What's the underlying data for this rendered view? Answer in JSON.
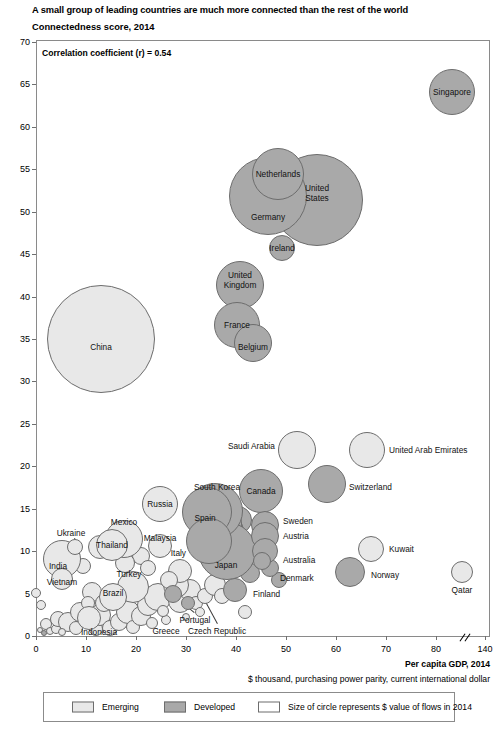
{
  "title": "A small group of leading countries are much more connected than the rest of the world",
  "subtitle": "Connectedness score, 2014",
  "annotation": "Correlation coefficient (r) = 0.54",
  "axis": {
    "x_title": "Per capita GDP, 2014",
    "x_subtitle": "$ thousand, purchasing power parity, current international dollar",
    "x_ticks": [
      "0",
      "10",
      "20",
      "30",
      "40",
      "50",
      "60",
      "70",
      "80",
      "140"
    ],
    "y_ticks": [
      "0",
      "5",
      "10",
      "15",
      "20",
      "25",
      "30",
      "35",
      "40",
      "45",
      "50",
      "55",
      "60",
      "65",
      "70"
    ]
  },
  "legend": {
    "emerging": "Emerging",
    "developed": "Developed",
    "size_note": "Size of circle represents $ value of flows in 2014"
  },
  "colors": {
    "emerging": "#e8e8e8",
    "developed": "#a9a9a9",
    "stroke": "#6d6d6d",
    "frame": "#8a8a8a"
  },
  "chart_data": {
    "type": "scatter",
    "title": "A small group of leading countries are much more connected than the rest of the world",
    "subtitle": "Connectedness score, 2014",
    "xlabel": "Per capita GDP, 2014 ($ thousand, purchasing power parity, current international dollar)",
    "ylabel": "Connectedness score, 2014",
    "xlim": [
      0,
      140
    ],
    "ylim": [
      0,
      70
    ],
    "x_axis_break_after": 80,
    "grid": false,
    "legend_position": "bottom",
    "annotations": [
      "Correlation coefficient (r) = 0.54"
    ],
    "size_encodes": "$ value of flows in 2014",
    "groups": [
      "Emerging",
      "Developed"
    ],
    "points": [
      {
        "name": "Singapore",
        "x": 83.0,
        "y": 65.0,
        "group": "Developed",
        "size": 23
      },
      {
        "name": "United States",
        "x": 55.0,
        "y": 51.5,
        "group": "Developed",
        "size": 46
      },
      {
        "name": "Netherlands",
        "x": 49.0,
        "y": 53.5,
        "group": "Developed",
        "size": 26
      },
      {
        "name": "Germany",
        "x": 46.5,
        "y": 51.0,
        "group": "Developed",
        "size": 39
      },
      {
        "name": "Ireland",
        "x": 49.5,
        "y": 45.5,
        "group": "Developed",
        "size": 13
      },
      {
        "name": "United Kingdom",
        "x": 40.5,
        "y": 41.5,
        "group": "Developed",
        "size": 24
      },
      {
        "name": "China",
        "x": 13.0,
        "y": 34.5,
        "group": "Emerging",
        "size": 54
      },
      {
        "name": "France",
        "x": 40.0,
        "y": 32.0,
        "group": "Developed",
        "size": 23
      },
      {
        "name": "Belgium",
        "x": 43.0,
        "y": 30.0,
        "group": "Developed",
        "size": 19
      },
      {
        "name": "Saudi Arabia",
        "x": 52.0,
        "y": 22.5,
        "group": "Emerging",
        "size": 19
      },
      {
        "name": "United Arab Emirates",
        "x": 66.0,
        "y": 22.5,
        "group": "Emerging",
        "size": 18
      },
      {
        "name": "Switzerland",
        "x": 58.0,
        "y": 18.5,
        "group": "Developed",
        "size": 19
      },
      {
        "name": "Canada",
        "x": 43.5,
        "y": 17.5,
        "group": "Developed",
        "size": 22
      },
      {
        "name": "South Korea",
        "x": 34.0,
        "y": 15.0,
        "group": "Developed",
        "size": 28
      },
      {
        "name": "Spain",
        "x": 33.0,
        "y": 15.0,
        "group": "Developed",
        "size": 25
      },
      {
        "name": "Russia",
        "x": 24.5,
        "y": 16.5,
        "group": "Emerging",
        "size": 18
      },
      {
        "name": "Sweden",
        "x": 45.0,
        "y": 13.5,
        "group": "Developed",
        "size": 14
      },
      {
        "name": "Austria",
        "x": 45.0,
        "y": 11.5,
        "group": "Developed",
        "size": 14
      },
      {
        "name": "Australia",
        "x": 45.0,
        "y": 9.0,
        "group": "Developed",
        "size": 13
      },
      {
        "name": "Denmark",
        "x": 45.0,
        "y": 7.5,
        "group": "Developed",
        "size": 9
      },
      {
        "name": "Japan",
        "x": 37.5,
        "y": 9.0,
        "group": "Developed",
        "size": 29
      },
      {
        "name": "Italy",
        "x": 34.5,
        "y": 11.0,
        "group": "Developed",
        "size": 23
      },
      {
        "name": "Malaysia",
        "x": 24.5,
        "y": 11.0,
        "group": "Emerging",
        "size": 12
      },
      {
        "name": "Mexico",
        "x": 17.0,
        "y": 12.5,
        "group": "Emerging",
        "size": 19
      },
      {
        "name": "Thailand",
        "x": 15.0,
        "y": 11.5,
        "group": "Emerging",
        "size": 16
      },
      {
        "name": "Ukraine",
        "x": 8.5,
        "y": 11.0,
        "group": "Emerging",
        "size": 8
      },
      {
        "name": "India",
        "x": 5.5,
        "y": 9.0,
        "group": "Emerging",
        "size": 19
      },
      {
        "name": "Vietnam",
        "x": 5.5,
        "y": 6.0,
        "group": "Emerging",
        "size": 11
      },
      {
        "name": "Turkey",
        "x": 19.5,
        "y": 6.5,
        "group": "Emerging",
        "size": 16
      },
      {
        "name": "Brazil",
        "x": 15.5,
        "y": 4.5,
        "group": "Emerging",
        "size": 14
      },
      {
        "name": "Portugal",
        "x": 27.5,
        "y": 5.0,
        "group": "Developed",
        "size": 9
      },
      {
        "name": "Greece",
        "x": 25.5,
        "y": 3.0,
        "group": "Emerging",
        "size": 6
      },
      {
        "name": "Czech Republic",
        "x": 30.5,
        "y": 4.0,
        "group": "Developed",
        "size": 7
      },
      {
        "name": "Finland",
        "x": 40.0,
        "y": 5.5,
        "group": "Developed",
        "size": 12
      },
      {
        "name": "Kuwait",
        "x": 67.0,
        "y": 10.5,
        "group": "Emerging",
        "size": 13
      },
      {
        "name": "Norway",
        "x": 63.0,
        "y": 6.5,
        "group": "Developed",
        "size": 15
      },
      {
        "name": "Qatar",
        "x": 85.0,
        "y": 7.5,
        "group": "Emerging",
        "size": 11
      },
      {
        "name": "Indonesia",
        "x": 10.5,
        "y": 2.0,
        "group": "Emerging",
        "size": 12
      }
    ]
  },
  "bubbles": [
    {
      "label": "Singapore",
      "cx": 452,
      "cy": 92,
      "r": 23,
      "group": "developed",
      "lx": 452,
      "ly": 92,
      "anchor": "center"
    },
    {
      "label": "United States",
      "cx": 317,
      "cy": 200,
      "r": 46,
      "group": "developed",
      "lx": 317,
      "ly": 193,
      "anchor": "center",
      "lines": [
        "United",
        "States"
      ]
    },
    {
      "label": "Netherlands",
      "cx": 278,
      "cy": 174,
      "r": 26,
      "group": "developed",
      "lx": 278,
      "ly": 174,
      "anchor": "center"
    },
    {
      "label": "Germany",
      "cx": 268,
      "cy": 196,
      "r": 39,
      "group": "developed",
      "lx": 268,
      "ly": 217,
      "anchor": "center"
    },
    {
      "label": "Ireland",
      "cx": 282,
      "cy": 248,
      "r": 13,
      "group": "developed",
      "lx": 282,
      "ly": 248,
      "anchor": "center"
    },
    {
      "label": "United Kingdom",
      "cx": 240,
      "cy": 285,
      "r": 24,
      "group": "developed",
      "lx": 240,
      "ly": 280,
      "anchor": "center",
      "lines": [
        "United",
        "Kingdom"
      ]
    },
    {
      "label": "China",
      "cx": 101,
      "cy": 339,
      "r": 54,
      "group": "emerging",
      "lx": 101,
      "ly": 347,
      "anchor": "center"
    },
    {
      "label": "France",
      "cx": 237,
      "cy": 325,
      "r": 23,
      "group": "developed",
      "lx": 237,
      "ly": 325,
      "anchor": "center"
    },
    {
      "label": "Belgium",
      "cx": 253,
      "cy": 343,
      "r": 19,
      "group": "developed",
      "lx": 253,
      "ly": 347,
      "anchor": "center"
    },
    {
      "label": "Saudi Arabia",
      "cx": 297,
      "cy": 450,
      "r": 19,
      "group": "emerging",
      "lx": 275,
      "ly": 446,
      "anchor": "right"
    },
    {
      "label": "United Arab Emirates",
      "cx": 367,
      "cy": 450,
      "r": 18,
      "group": "emerging",
      "lx": 389,
      "ly": 450,
      "anchor": "left"
    },
    {
      "label": "Switzerland",
      "cx": 327,
      "cy": 484,
      "r": 19,
      "group": "developed",
      "lx": 349,
      "ly": 487,
      "anchor": "left"
    },
    {
      "label": "Canada",
      "cx": 261,
      "cy": 491,
      "r": 22,
      "group": "developed",
      "lx": 261,
      "ly": 491,
      "anchor": "center"
    },
    {
      "label": "South Korea",
      "cx": 215,
      "cy": 511,
      "r": 28,
      "group": "developed",
      "lx": 217,
      "ly": 487,
      "anchor": "center"
    },
    {
      "label": "Spain",
      "cx": 207,
      "cy": 512,
      "r": 25,
      "group": "developed",
      "lx": 205,
      "ly": 518,
      "anchor": "center"
    },
    {
      "label": "Russia",
      "cx": 160,
      "cy": 504,
      "r": 18,
      "group": "emerging",
      "lx": 160,
      "ly": 504,
      "anchor": "center"
    },
    {
      "label": "Sweden",
      "cx": 265,
      "cy": 525,
      "r": 14,
      "group": "developed",
      "lx": 283,
      "ly": 521,
      "anchor": "left"
    },
    {
      "label": "Austria",
      "cx": 265,
      "cy": 536,
      "r": 14,
      "group": "developed",
      "lx": 283,
      "ly": 536,
      "anchor": "left"
    },
    {
      "label": "Australia",
      "cx": 265,
      "cy": 551,
      "r": 13,
      "group": "developed",
      "lx": 283,
      "ly": 560,
      "anchor": "left"
    },
    {
      "label": "Denmark",
      "cx": 262,
      "cy": 561,
      "r": 9,
      "group": "developed",
      "lx": 280,
      "ly": 578,
      "anchor": "left"
    },
    {
      "label": "Japan",
      "cx": 227,
      "cy": 551,
      "r": 29,
      "group": "developed",
      "lx": 226,
      "ly": 565,
      "anchor": "center"
    },
    {
      "label": "Italy",
      "cx": 209,
      "cy": 541,
      "r": 23,
      "group": "developed",
      "lx": 186,
      "ly": 553,
      "anchor": "right"
    },
    {
      "label": "Malaysia",
      "cx": 160,
      "cy": 546,
      "r": 12,
      "group": "emerging",
      "lx": 160,
      "ly": 538,
      "anchor": "center"
    },
    {
      "label": "Mexico",
      "cx": 124,
      "cy": 539,
      "r": 19,
      "group": "emerging",
      "lx": 124,
      "ly": 522,
      "anchor": "center"
    },
    {
      "label": "Thailand",
      "cx": 112,
      "cy": 545,
      "r": 16,
      "group": "emerging",
      "lx": 112,
      "ly": 545,
      "anchor": "center"
    },
    {
      "label": "Ukraine",
      "cx": 75,
      "cy": 547,
      "r": 8,
      "group": "emerging",
      "lx": 71,
      "ly": 533,
      "anchor": "center"
    },
    {
      "label": "India",
      "cx": 62,
      "cy": 559,
      "r": 19,
      "group": "emerging",
      "lx": 58,
      "ly": 566,
      "anchor": "center"
    },
    {
      "label": "Vietnam",
      "cx": 62,
      "cy": 579,
      "r": 11,
      "group": "emerging",
      "lx": 62,
      "ly": 582,
      "anchor": "center"
    },
    {
      "label": "Turkey",
      "cx": 133,
      "cy": 587,
      "r": 16,
      "group": "emerging",
      "lx": 129,
      "ly": 574,
      "anchor": "center"
    },
    {
      "label": "Brazil",
      "cx": 113,
      "cy": 597,
      "r": 14,
      "group": "emerging",
      "lx": 113,
      "ly": 593,
      "anchor": "center"
    },
    {
      "label": "Portugal",
      "cx": 173,
      "cy": 594,
      "r": 9,
      "group": "developed",
      "lx": 195,
      "ly": 620,
      "anchor": "center"
    },
    {
      "label": "Greece",
      "cx": 163,
      "cy": 611,
      "r": 6,
      "group": "emerging",
      "lx": 166,
      "ly": 631,
      "anchor": "center"
    },
    {
      "label": "Czech Republic",
      "cx": 188,
      "cy": 603,
      "r": 7,
      "group": "developed",
      "lx": 217,
      "ly": 631,
      "anchor": "center"
    },
    {
      "label": "Finland",
      "cx": 235,
      "cy": 590,
      "r": 12,
      "group": "developed",
      "lx": 253,
      "ly": 594,
      "anchor": "left"
    },
    {
      "label": "Kuwait",
      "cx": 371,
      "cy": 549,
      "r": 13,
      "group": "emerging",
      "lx": 389,
      "ly": 549,
      "anchor": "left"
    },
    {
      "label": "Norway",
      "cx": 350,
      "cy": 572,
      "r": 15,
      "group": "developed",
      "lx": 371,
      "ly": 575,
      "anchor": "left"
    },
    {
      "label": "Qatar",
      "cx": 462,
      "cy": 572,
      "r": 11,
      "group": "emerging",
      "lx": 462,
      "ly": 590,
      "anchor": "center"
    },
    {
      "label": "Indonesia",
      "cx": 89,
      "cy": 618,
      "r": 12,
      "group": "emerging",
      "lx": 99,
      "ly": 632,
      "anchor": "center"
    }
  ],
  "extra_bubbles": [
    {
      "cx": 41,
      "cy": 605,
      "r": 5,
      "group": "emerging"
    },
    {
      "cx": 46,
      "cy": 624,
      "r": 6,
      "group": "emerging"
    },
    {
      "cx": 40,
      "cy": 630,
      "r": 3,
      "group": "emerging"
    },
    {
      "cx": 44,
      "cy": 633,
      "r": 3,
      "group": "developed"
    },
    {
      "cx": 50,
      "cy": 631,
      "r": 4,
      "group": "emerging"
    },
    {
      "cx": 56,
      "cy": 629,
      "r": 5,
      "group": "emerging"
    },
    {
      "cx": 58,
      "cy": 619,
      "r": 8,
      "group": "emerging"
    },
    {
      "cx": 68,
      "cy": 622,
      "r": 10,
      "group": "emerging"
    },
    {
      "cx": 62,
      "cy": 632,
      "r": 4,
      "group": "emerging"
    },
    {
      "cx": 76,
      "cy": 628,
      "r": 7,
      "group": "emerging"
    },
    {
      "cx": 80,
      "cy": 612,
      "r": 10,
      "group": "emerging"
    },
    {
      "cx": 96,
      "cy": 629,
      "r": 7,
      "group": "emerging"
    },
    {
      "cx": 100,
      "cy": 615,
      "r": 11,
      "group": "emerging"
    },
    {
      "cx": 110,
      "cy": 628,
      "r": 8,
      "group": "emerging"
    },
    {
      "cx": 119,
      "cy": 622,
      "r": 9,
      "group": "emerging"
    },
    {
      "cx": 128,
      "cy": 612,
      "r": 12,
      "group": "emerging"
    },
    {
      "cx": 133,
      "cy": 627,
      "r": 7,
      "group": "emerging"
    },
    {
      "cx": 141,
      "cy": 616,
      "r": 10,
      "group": "emerging"
    },
    {
      "cx": 148,
      "cy": 605,
      "r": 11,
      "group": "emerging"
    },
    {
      "cx": 152,
      "cy": 623,
      "r": 6,
      "group": "emerging"
    },
    {
      "cx": 158,
      "cy": 597,
      "r": 14,
      "group": "emerging"
    },
    {
      "cx": 166,
      "cy": 620,
      "r": 5,
      "group": "emerging"
    },
    {
      "cx": 180,
      "cy": 601,
      "r": 12,
      "group": "emerging"
    },
    {
      "cx": 190,
      "cy": 590,
      "r": 11,
      "group": "emerging"
    },
    {
      "cx": 196,
      "cy": 603,
      "r": 7,
      "group": "emerging"
    },
    {
      "cx": 176,
      "cy": 585,
      "r": 13,
      "group": "emerging"
    },
    {
      "cx": 205,
      "cy": 596,
      "r": 8,
      "group": "emerging"
    },
    {
      "cx": 200,
      "cy": 612,
      "r": 5,
      "group": "emerging"
    },
    {
      "cx": 186,
      "cy": 617,
      "r": 4,
      "group": "emerging"
    },
    {
      "cx": 92,
      "cy": 592,
      "r": 10,
      "group": "emerging"
    },
    {
      "cx": 88,
      "cy": 603,
      "r": 7,
      "group": "emerging"
    },
    {
      "cx": 104,
      "cy": 603,
      "r": 9,
      "group": "emerging"
    },
    {
      "cx": 215,
      "cy": 585,
      "r": 11,
      "group": "emerging"
    },
    {
      "cx": 222,
      "cy": 596,
      "r": 8,
      "group": "emerging"
    },
    {
      "cx": 245,
      "cy": 612,
      "r": 7,
      "group": "emerging"
    },
    {
      "cx": 250,
      "cy": 573,
      "r": 10,
      "group": "developed"
    },
    {
      "cx": 141,
      "cy": 556,
      "r": 9,
      "group": "emerging"
    },
    {
      "cx": 148,
      "cy": 568,
      "r": 8,
      "group": "emerging"
    },
    {
      "cx": 125,
      "cy": 563,
      "r": 10,
      "group": "emerging"
    },
    {
      "cx": 180,
      "cy": 571,
      "r": 12,
      "group": "emerging"
    },
    {
      "cx": 169,
      "cy": 580,
      "r": 9,
      "group": "emerging"
    },
    {
      "cx": 100,
      "cy": 547,
      "r": 12,
      "group": "emerging"
    },
    {
      "cx": 83,
      "cy": 566,
      "r": 8,
      "group": "emerging"
    },
    {
      "cx": 36,
      "cy": 593,
      "r": 5,
      "group": "emerging"
    },
    {
      "cx": 279,
      "cy": 580,
      "r": 8,
      "group": "developed"
    },
    {
      "cx": 270,
      "cy": 568,
      "r": 9,
      "group": "developed"
    },
    {
      "cx": 255,
      "cy": 555,
      "r": 6,
      "group": "developed"
    },
    {
      "cx": 238,
      "cy": 520,
      "r": 14,
      "group": "developed"
    },
    {
      "cx": 224,
      "cy": 532,
      "r": 20,
      "group": "developed"
    },
    {
      "cx": 217,
      "cy": 524,
      "r": 25,
      "group": "developed"
    }
  ],
  "leaders": [
    {
      "x1": 226,
      "y1": 492,
      "x2": 219,
      "y2": 504
    },
    {
      "x1": 75,
      "y1": 538,
      "x2": 78,
      "y2": 546
    },
    {
      "x1": 194,
      "y1": 613,
      "x2": 176,
      "y2": 598
    },
    {
      "x1": 217,
      "y1": 624,
      "x2": 204,
      "y2": 600
    },
    {
      "x1": 166,
      "y1": 624,
      "x2": 164,
      "y2": 615
    },
    {
      "x1": 277,
      "y1": 576,
      "x2": 266,
      "y2": 566
    },
    {
      "x1": 192,
      "y1": 553,
      "x2": 202,
      "y2": 551
    }
  ]
}
